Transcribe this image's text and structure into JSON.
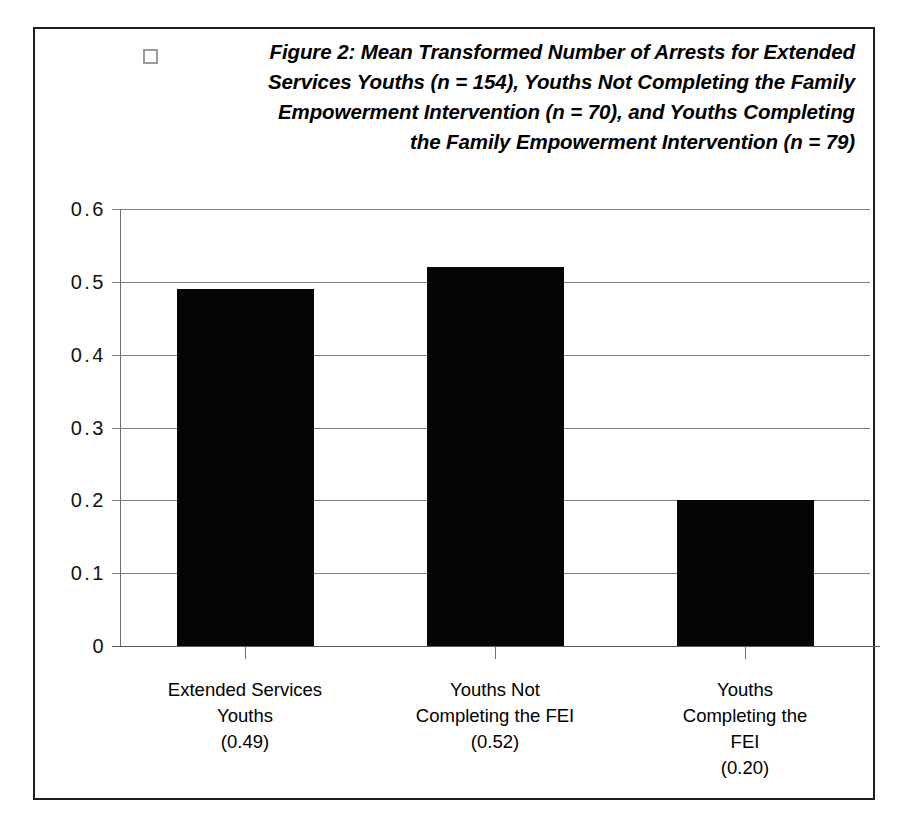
{
  "figure": {
    "bullet_icon": "open-square-bullet",
    "title_lines": [
      "Figure 2: Mean Transformed Number of Arrests for Extended",
      "Services Youths (n = 154), Youths Not Completing the Family",
      "Empowerment Intervention  (n = 70), and Youths  Completing",
      "the Family Empowerment Intervention (n = 79)"
    ],
    "border_color": "#1c1c1c",
    "bar_color": "#050505",
    "grid_color": "#7d7d7d"
  },
  "chart_data": {
    "type": "bar",
    "xlabel": "",
    "ylabel": "",
    "categories": [
      "Extended Services Youths (0.49)",
      "Youths Not Completing the FEI (0.52)",
      "Youths Completing the FEI (0.20)"
    ],
    "category_label_lines": [
      [
        "Extended Services",
        "Youths",
        "(0.49)"
      ],
      [
        "Youths Not",
        "Completing the FEI",
        "(0.52)"
      ],
      [
        "Youths",
        "Completing the",
        "FEI",
        "(0.20)"
      ]
    ],
    "values": [
      0.49,
      0.52,
      0.2
    ],
    "value_labels": [
      "(0.49)",
      "(0.52)",
      "(0.20)"
    ],
    "group_sizes": [
      154,
      70,
      79
    ],
    "ylim": [
      0,
      0.6
    ],
    "ytick_values": [
      0.6,
      0.5,
      0.4,
      0.3,
      0.2,
      0.1,
      0
    ],
    "ytick_labels": [
      "0.6",
      "0.5",
      "0.4",
      "0.3",
      "0.2",
      "0.1",
      "0"
    ],
    "grid": true,
    "legend": false,
    "legend_position": "none",
    "series": [
      {
        "name": "Mean Transformed Number of Arrests",
        "values": [
          0.49,
          0.52,
          0.2
        ]
      }
    ]
  }
}
